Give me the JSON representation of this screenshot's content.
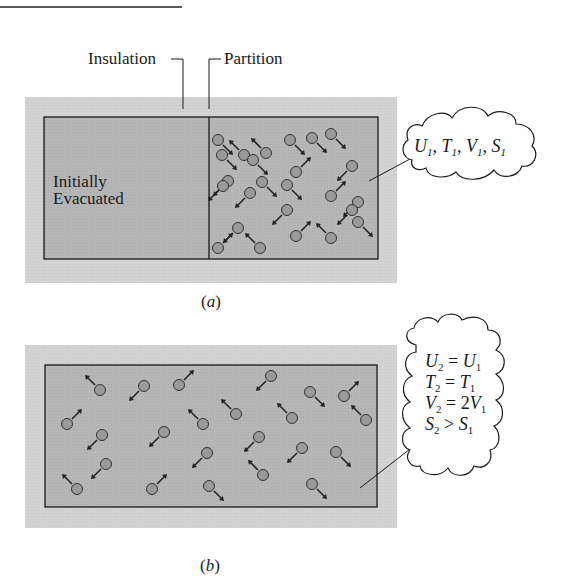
{
  "figure": {
    "labels": {
      "insulation": "Insulation",
      "partition": "Partition",
      "evacuated_line1": "Initially",
      "evacuated_line2": "Evacuated",
      "caption_a": "(a)",
      "caption_b": "(b)"
    },
    "state1": {
      "text": "U₁, T₁, V₁, S₁",
      "parts": [
        {
          "v": "U",
          "s": "1"
        },
        {
          "v": "T",
          "s": "1"
        },
        {
          "v": "V",
          "s": "1"
        },
        {
          "v": "S",
          "s": "1"
        }
      ]
    },
    "state2": {
      "lines": [
        {
          "lhs": "U",
          "ls": "2",
          "op": "=",
          "rhs": "U",
          "rs": "1",
          "coef": ""
        },
        {
          "lhs": "T",
          "ls": "2",
          "op": "=",
          "rhs": "T",
          "rs": "1",
          "coef": ""
        },
        {
          "lhs": "V",
          "ls": "2",
          "op": "=",
          "rhs": "V",
          "rs": "1",
          "coef": "2"
        },
        {
          "lhs": "S",
          "ls": "2",
          "op": ">",
          "rhs": "S",
          "rs": "1",
          "coef": ""
        }
      ]
    },
    "colors": {
      "insulation_fill": "#d4d4d4",
      "chamber_fill": "#b5b5b5",
      "molecule_fill": "#9a9a9a",
      "line": "#1a1a1a"
    },
    "molecules_a": [
      [
        218,
        140,
        "se"
      ],
      [
        244,
        155,
        "nw"
      ],
      [
        266,
        153,
        "nw"
      ],
      [
        290,
        140,
        "se"
      ],
      [
        312,
        138,
        "se"
      ],
      [
        331,
        134,
        "se"
      ],
      [
        222,
        155,
        "se"
      ],
      [
        253,
        160,
        "se"
      ],
      [
        228,
        181,
        "sw"
      ],
      [
        262,
        182,
        "se"
      ],
      [
        296,
        172,
        "ne"
      ],
      [
        352,
        166,
        "sw"
      ],
      [
        223,
        186,
        "sw"
      ],
      [
        250,
        193,
        "sw"
      ],
      [
        287,
        185,
        "se"
      ],
      [
        331,
        196,
        "ne"
      ],
      [
        358,
        202,
        "sw"
      ],
      [
        238,
        228,
        "sw"
      ],
      [
        287,
        210,
        "sw"
      ],
      [
        358,
        222,
        "se"
      ],
      [
        218,
        248,
        "ne"
      ],
      [
        260,
        248,
        "nw"
      ],
      [
        296,
        236,
        "ne"
      ],
      [
        331,
        238,
        "nw"
      ],
      [
        352,
        210,
        "sw"
      ]
    ],
    "molecules_b": [
      [
        100,
        390,
        "nw"
      ],
      [
        144,
        386,
        "sw"
      ],
      [
        179,
        385,
        "ne"
      ],
      [
        271,
        376,
        "sw"
      ],
      [
        310,
        392,
        "se"
      ],
      [
        344,
        396,
        "ne"
      ],
      [
        67,
        424,
        "ne"
      ],
      [
        102,
        435,
        "sw"
      ],
      [
        164,
        432,
        "sw"
      ],
      [
        203,
        424,
        "nw"
      ],
      [
        236,
        414,
        "nw"
      ],
      [
        292,
        418,
        "nw"
      ],
      [
        366,
        420,
        "nw"
      ],
      [
        106,
        464,
        "sw"
      ],
      [
        207,
        453,
        "sw"
      ],
      [
        259,
        437,
        "sw"
      ],
      [
        302,
        448,
        "sw"
      ],
      [
        336,
        452,
        "se"
      ],
      [
        77,
        489,
        "nw"
      ],
      [
        152,
        489,
        "ne"
      ],
      [
        209,
        486,
        "se"
      ],
      [
        263,
        475,
        "nw"
      ],
      [
        312,
        484,
        "se"
      ]
    ]
  }
}
